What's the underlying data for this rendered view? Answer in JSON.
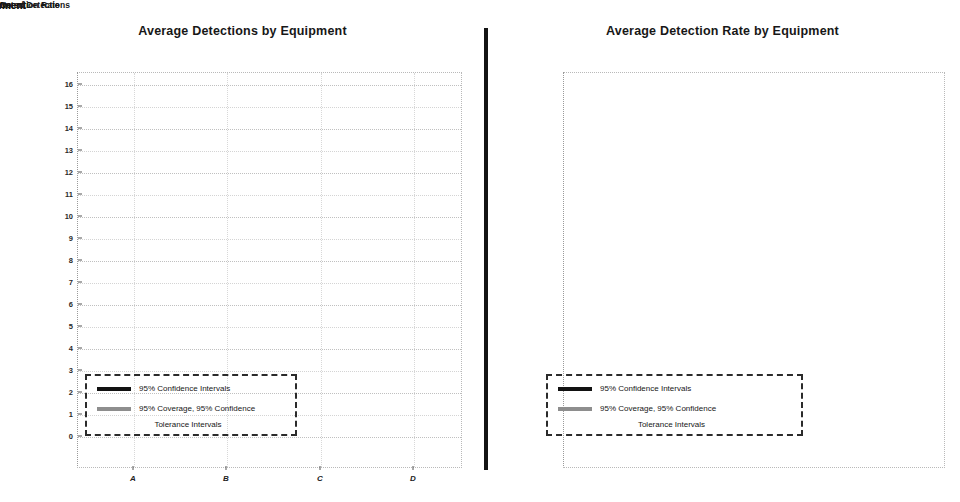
{
  "figure": {
    "background": "#ffffff",
    "ink_color": "#121212",
    "tolerance_color": "#8e8e8e",
    "divider": "vertical-rule"
  },
  "panels": [
    {
      "id": "left",
      "title": "Average Detections by Equipment",
      "xlabel": "Equipment",
      "ylabel": "No. of Detections",
      "legend": {
        "ci_label": "95% Confidence Intervals",
        "tol_label_line1": "95% Coverage, 95% Confidence",
        "tol_label_line2": "Tolerance Intervals"
      }
    },
    {
      "id": "right",
      "title": "Average Detection Rate by Equipment",
      "xlabel": "Equipment",
      "ylabel": "Detection Rate",
      "legend": {
        "ci_label": "95% Confidence Intervals",
        "tol_label_line1": "95% Coverage, 95% Confidence",
        "tol_label_line2": "Tolerance Intervals"
      }
    }
  ],
  "chart_data": [
    {
      "type": "scatter",
      "id": "average-detections-by-equipment",
      "title": "Average Detections by Equipment",
      "xlabel": "Equipment",
      "ylabel": "No. of Detections",
      "categories": [
        "A",
        "B",
        "C",
        "D"
      ],
      "ylim": [
        0,
        16
      ],
      "yticks": [
        0,
        1,
        2,
        3,
        4,
        5,
        6,
        7,
        8,
        9,
        10,
        11,
        12,
        13,
        14,
        15,
        16
      ],
      "ytick_labels": [
        "0",
        "1",
        "2",
        "3",
        "4",
        "5",
        "6",
        "7",
        "8",
        "9",
        "10",
        "11",
        "12",
        "13",
        "14",
        "15",
        "16"
      ],
      "grid": true,
      "legend_position": "lower-left-inside",
      "series": [
        {
          "name": "Mean",
          "values": [
            13.05,
            13.05,
            9.1,
            10.1
          ]
        },
        {
          "name": "95% Confidence Intervals",
          "lower": [
            9.0,
            9.9,
            5.0,
            6.0
          ],
          "upper": [
            14.9,
            13.1,
            12.3,
            11.1
          ]
        },
        {
          "name": "95% Coverage, 95% Confidence Tolerance Intervals",
          "lower": [
            5.0,
            7.0,
            2.0,
            3.0
          ],
          "upper": [
            15.0,
            13.1,
            14.0,
            11.1
          ]
        }
      ]
    },
    {
      "type": "scatter",
      "id": "average-detection-rate-by-equipment",
      "title": "Average Detection Rate by Equipment",
      "xlabel": "Equipment",
      "ylabel": "Detection Rate",
      "categories": [
        "A",
        "B",
        "C",
        "D"
      ],
      "ylim": [
        0.0,
        1.05
      ],
      "yticks": [
        0.0,
        0.1,
        0.2,
        0.3,
        0.4,
        0.5,
        0.6,
        0.7,
        0.8,
        0.9,
        1.0
      ],
      "ytick_labels": [
        "0.0",
        "0.1",
        "0.2",
        "0.3",
        "0.4",
        "0.5",
        "0.6",
        "0.7",
        "0.8",
        "0.9",
        "1.0"
      ],
      "grid": true,
      "legend_position": "lower-left-inside",
      "series": [
        {
          "name": "Mean",
          "values": [
            0.868,
            1.0,
            0.65,
            0.915
          ]
        },
        {
          "name": "95% Confidence Intervals",
          "lower": [
            0.6,
            0.757,
            0.357,
            0.593
          ],
          "upper": [
            1.0,
            1.0,
            0.878,
            1.0
          ]
        },
        {
          "name": "95% Coverage, 95% Confidence Tolerance Intervals",
          "lower": [
            0.335,
            0.543,
            0.145,
            0.272
          ],
          "upper": [
            1.005,
            1.005,
            1.005,
            1.005
          ]
        }
      ]
    }
  ]
}
